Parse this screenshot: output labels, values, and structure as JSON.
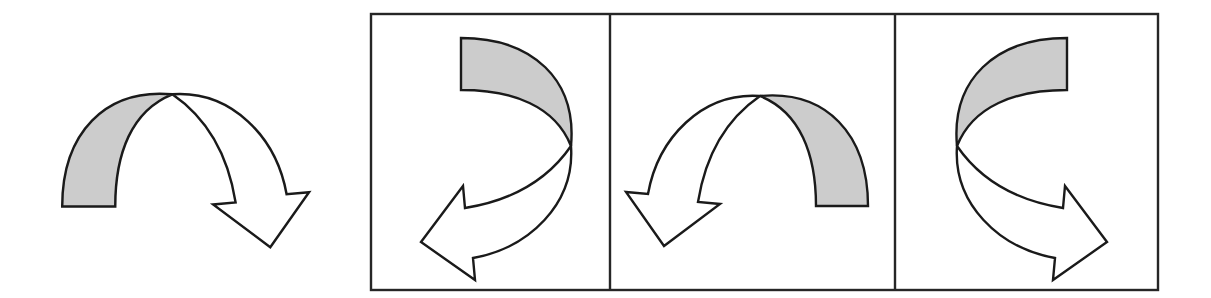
{
  "page": {
    "type": "visual-reasoning-puzzle",
    "subtype": "mental-rotation",
    "background_color": "#ffffff",
    "width": 1211,
    "height": 298
  },
  "colors": {
    "shaded_band_fill": "#cccccc",
    "unshaded_band_fill": "#ffffff",
    "outline": "#1a1a1a",
    "frame_border": "#262626",
    "background": "#ffffff"
  },
  "prompt": {
    "name": "reference-figure",
    "description": "Curved arch-shaped arrow; left half of the band is filled light gray, right half is white and terminates in a large open arrowhead pointing down-right.",
    "arrow_direction": "down-right",
    "shaded_side": "left",
    "rotation_degrees": 0
  },
  "answer_frame": {
    "name": "options-frame",
    "x": 371,
    "y": 14,
    "width": 787,
    "height": 276,
    "divider_positions": [
      610,
      895
    ],
    "option_count": 3
  },
  "options": [
    {
      "id": "option-a",
      "index": 1,
      "description": "Reference arrow rotated 90 degrees clockwise; gray band at top, arrowhead points down-left.",
      "arrow_direction": "down-left",
      "shaded_side": "top",
      "rotation_degrees": 90,
      "mirrored": false
    },
    {
      "id": "option-b",
      "index": 2,
      "description": "Reference arrow mirrored horizontally; gray band on the right, arrowhead points down-left.",
      "arrow_direction": "down-left",
      "shaded_side": "right",
      "rotation_degrees": 0,
      "mirrored": true
    },
    {
      "id": "option-c",
      "index": 3,
      "description": "Reference arrow rotated 90 degrees counter-clockwise and mirrored; gray band at top-right, arrowhead points down-right.",
      "arrow_direction": "down-right",
      "shaded_side": "top-right",
      "rotation_degrees": -90,
      "mirrored": true
    }
  ]
}
